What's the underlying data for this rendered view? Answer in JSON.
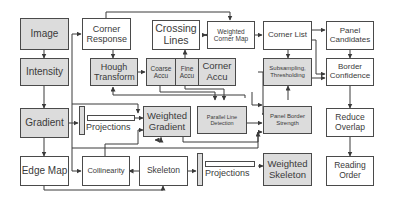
{
  "diagram": {
    "nodes": {
      "image": "Image",
      "intensity": "Intensity",
      "gradient": "Gradient",
      "edge_map": "Edge Map",
      "corner_response": "Corner Response",
      "hough_transform": "Hough Transform",
      "coarse_accu": "Coarse Accu",
      "fine_accu": "Fine Accu",
      "corner_accu": "Corner Accu",
      "crossing_lines": "Crossing Lines",
      "weighted_corner_map": "Weighted Corner Map",
      "corner_list": "Corner List",
      "subsampling_thresholding": "Subsampling, Thresholding",
      "panel_candidates": "Panel Candidates",
      "border_confidence": "Border Confidence",
      "reduce_overlap": "Reduce Overlap",
      "reading_order": "Reading Order",
      "weighted_gradient": "Weighted Gradient",
      "parallel_line_detection": "Parallel Line Detection",
      "panel_border_strength": "Panel Border Strength",
      "collinearity": "Collinearity",
      "skeleton": "Skeleton",
      "weighted_skeleton": "Weighted Skeleton",
      "projections_1": "Projections",
      "projections_2": "Projections"
    },
    "colors": {
      "grey_fill": "#dcdcdc",
      "white_fill": "#ffffff",
      "stroke": "#4a4a4a"
    }
  }
}
